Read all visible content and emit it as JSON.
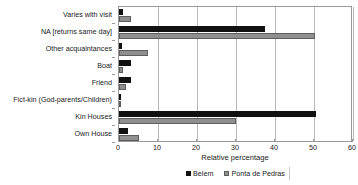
{
  "chart_data": {
    "type": "bar",
    "orientation": "horizontal",
    "title": "",
    "xlabel": "Relative percentage",
    "ylabel": "",
    "xlim": [
      0,
      60
    ],
    "xticks": [
      0,
      10,
      20,
      30,
      40,
      50,
      60
    ],
    "grid": true,
    "legend_position": "bottom",
    "categories": [
      "Varies with visit",
      "NA [returns same day]",
      "Other acquaintances",
      "Boat",
      "Friend",
      "Fict-kin (God-parents/Children)",
      "Kin Houses",
      "Own House"
    ],
    "series": [
      {
        "name": "Belem",
        "color": "#111111",
        "values": [
          1.0,
          37.5,
          0.7,
          3.0,
          3.0,
          0.5,
          50.5,
          2.2
        ]
      },
      {
        "name": "Ponta de Pedras",
        "color": "#8f8f8f",
        "values": [
          3.0,
          50.3,
          7.5,
          1.0,
          1.7,
          0.3,
          30.0,
          5.0
        ]
      }
    ]
  },
  "axis": {
    "x_title": "Relative percentage",
    "x_tick_labels": [
      "0",
      "10",
      "20",
      "30",
      "40",
      "50",
      "60"
    ]
  },
  "legend": {
    "items": [
      {
        "label": "Belem",
        "color": "#111111"
      },
      {
        "label": "Ponta de Pedras",
        "color": "#8f8f8f"
      }
    ]
  }
}
